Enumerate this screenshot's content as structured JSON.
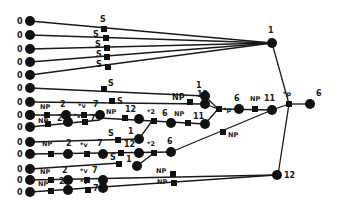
{
  "diagram": {
    "type": "tree-network",
    "left_leaf_label": "0",
    "left_leaves_y": [
      21,
      35,
      49,
      62,
      75,
      88,
      102,
      115,
      127,
      142,
      154,
      169,
      180,
      192
    ],
    "labels": {
      "s": "S",
      "np": "NP",
      "two": "2",
      "seven": "7",
      "star_v": "*v",
      "star_p": "*p",
      "star_2": "*2",
      "one": "1",
      "six": "6",
      "eleven": "11",
      "twelve": "12"
    },
    "top_hub": {
      "label": "1"
    },
    "right_end": {
      "label": "6"
    },
    "bottom_hub": {
      "label": "12"
    },
    "colors": {
      "ink": "#111111",
      "background": "#ffffff"
    }
  }
}
